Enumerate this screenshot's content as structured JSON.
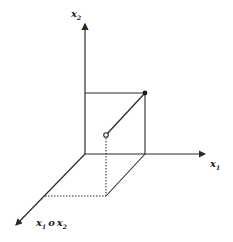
{
  "diagram": {
    "axes": {
      "x1": {
        "label": "x",
        "subscript": "1"
      },
      "x2": {
        "label": "x",
        "subscript": "2"
      },
      "diag": {
        "label_a": "x",
        "sub_a": "1",
        "op": "o",
        "label_b": "x",
        "sub_b": "2"
      }
    },
    "colors": {
      "stroke": "#2a2a2a",
      "background": "#ffffff"
    }
  }
}
